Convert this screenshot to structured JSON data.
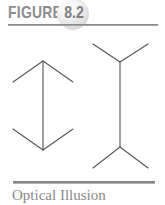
{
  "figure": {
    "label": "FIGURE",
    "number": "8.2",
    "caption": "Optical Illusion",
    "colors": {
      "label_gray": "#8d8d8d",
      "number_gray": "#7f7f7f",
      "rule_gray": "#8a8a8a",
      "caption_gray": "#8a8a8a",
      "line_gray": "#555555",
      "background": "#ffffff",
      "sphere_light": "#ffffff",
      "sphere_dark": "#c9c9c9"
    }
  },
  "illustration": {
    "name": "muller-lyer-illusion",
    "description": "Two vertical lines of equal length with arrowheads; left has inward-pointing fins, right has outward-pointing fins.",
    "stroke_color": "#555555",
    "stroke_width": 1.1,
    "shapes": [
      {
        "name": "left-figure-inward-arrows",
        "shaft": {
          "x1": 43,
          "y1": 31,
          "x2": 43,
          "y2": 120
        },
        "fins": [
          {
            "name": "top-left-fin",
            "x1": 43,
            "y1": 31,
            "x2": 13,
            "y2": 52
          },
          {
            "name": "top-right-fin",
            "x1": 43,
            "y1": 31,
            "x2": 73,
            "y2": 52
          },
          {
            "name": "bottom-left-fin",
            "x1": 43,
            "y1": 120,
            "x2": 13,
            "y2": 99
          },
          {
            "name": "bottom-right-fin",
            "x1": 43,
            "y1": 120,
            "x2": 73,
            "y2": 99
          }
        ]
      },
      {
        "name": "right-figure-outward-arrows",
        "shaft": {
          "x1": 120,
          "y1": 32,
          "x2": 120,
          "y2": 117
        },
        "fins": [
          {
            "name": "top-left-fin",
            "x1": 120,
            "y1": 32,
            "x2": 93,
            "y2": 14
          },
          {
            "name": "top-right-fin",
            "x1": 120,
            "y1": 32,
            "x2": 148,
            "y2": 14
          },
          {
            "name": "bottom-left-fin",
            "x1": 120,
            "y1": 117,
            "x2": 93,
            "y2": 138
          },
          {
            "name": "bottom-right-fin",
            "x1": 120,
            "y1": 117,
            "x2": 148,
            "y2": 138
          }
        ]
      }
    ]
  }
}
